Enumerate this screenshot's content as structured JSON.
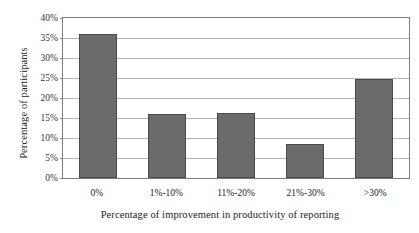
{
  "chart_data": {
    "type": "bar",
    "title": "",
    "categories": [
      "0%",
      "1%-10%",
      "11%-20%",
      "21%-30%",
      ">30%"
    ],
    "values": [
      36.0,
      16.0,
      16.3,
      8.6,
      24.7
    ],
    "value_labels": [
      "36%",
      "16%",
      "16.3%",
      "8.6%",
      "24.7%"
    ],
    "xlabel": "Percentage of improvement in productivity of reporting",
    "ylabel": "Percentage of participants",
    "ylim": [
      0,
      40
    ],
    "ytick_values": [
      40,
      35,
      30,
      25,
      20,
      15,
      10,
      5,
      0
    ],
    "yticks": [
      "40%",
      "35%",
      "30%",
      "25%",
      "20%",
      "15%",
      "10%",
      "5%",
      "0%"
    ],
    "grid": true,
    "grid_axis": "y",
    "legend": null,
    "legend_position": "none",
    "bar_color": "#6b6b6b",
    "bar_edge_color": "#4a4a4a",
    "grid_color": "#b4b4b4",
    "axis_color": "#7d7d7d",
    "plot_background": "#ffffff",
    "text_color": "#232323"
  }
}
